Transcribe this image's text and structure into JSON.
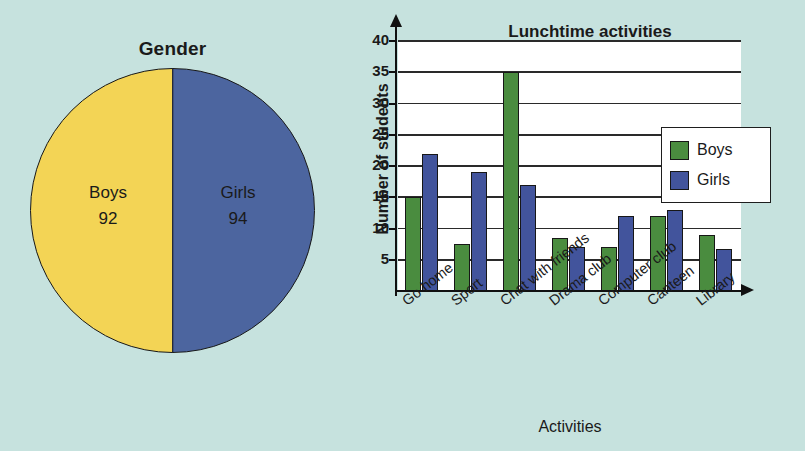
{
  "background_color": "#c6e2de",
  "pie": {
    "title": "Gender",
    "slices": [
      {
        "label": "Boys",
        "value": "92",
        "color": "#f3d455"
      },
      {
        "label": "Girls",
        "value": "94",
        "color": "#4c659f"
      }
    ]
  },
  "bar": {
    "title": "Lunchtime activities",
    "ylabel": "Number of students",
    "xlabel": "Activities",
    "legend": [
      {
        "label": "Boys",
        "color": "#4a8c3f"
      },
      {
        "label": "Girls",
        "color": "#42549c"
      }
    ],
    "yticks": [
      "5",
      "10",
      "15",
      "20",
      "25",
      "30",
      "35",
      "40"
    ]
  },
  "chart_data": [
    {
      "type": "pie",
      "title": "Gender",
      "categories": [
        "Boys",
        "Girls"
      ],
      "values": [
        92,
        94
      ],
      "colors": [
        "#f3d455",
        "#4c659f"
      ],
      "legend": "none",
      "labels_inside": true
    },
    {
      "type": "bar",
      "title": "Lunchtime activities",
      "xlabel": "Activities",
      "ylabel": "Number of students",
      "categories": [
        "Go home",
        "Sport",
        "Chat with friends",
        "Drama club",
        "Computer club",
        "Canteen",
        "Library"
      ],
      "series": [
        {
          "name": "Boys",
          "color": "#4a8c3f",
          "values": [
            15,
            7.5,
            35,
            8.5,
            7,
            12,
            9
          ]
        },
        {
          "name": "Girls",
          "color": "#42549c",
          "values": [
            22,
            19,
            17,
            7,
            12,
            13,
            6.8
          ]
        }
      ],
      "ylim": [
        0,
        40
      ],
      "yticks": [
        5,
        10,
        15,
        20,
        25,
        30,
        35,
        40
      ],
      "grid": "horizontal",
      "legend_position": "top-right"
    }
  ]
}
